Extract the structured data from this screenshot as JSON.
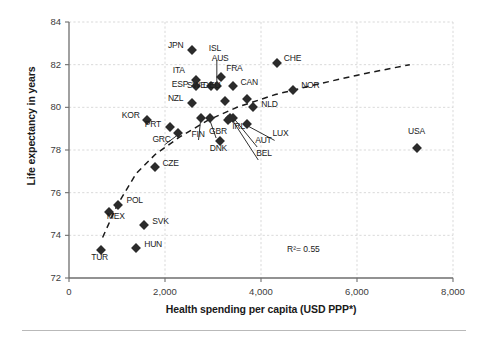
{
  "chart_data": {
    "type": "scatter",
    "title": "",
    "xlabel": "Health spending per capita (USD PPP*)",
    "ylabel": "Life expectancy in years",
    "xlim": [
      0,
      8000
    ],
    "ylim": [
      72,
      84
    ],
    "xticks": [
      "0",
      "2,000",
      "4,000",
      "6,000",
      "8,000"
    ],
    "xtick_values": [
      0,
      2000,
      4000,
      6000,
      8000
    ],
    "yticks": [
      "72",
      "74",
      "76",
      "78",
      "80",
      "82",
      "84"
    ],
    "ytick_values": [
      72,
      74,
      76,
      78,
      80,
      82,
      84
    ],
    "grid": true,
    "legend": "none",
    "annotations": [
      {
        "name": "r-squared",
        "text": "R²= 0.55",
        "x": 5000,
        "y": 73.3
      }
    ],
    "trendline": {
      "style": "dashed",
      "description": "logarithmic fit rising from lower-left to upper-right",
      "points": [
        {
          "x": 700,
          "y": 73.9
        },
        {
          "x": 1000,
          "y": 75.4
        },
        {
          "x": 1400,
          "y": 76.9
        },
        {
          "x": 1800,
          "y": 77.8
        },
        {
          "x": 2300,
          "y": 78.6
        },
        {
          "x": 2900,
          "y": 79.4
        },
        {
          "x": 3500,
          "y": 80.0
        },
        {
          "x": 4300,
          "y": 80.6
        },
        {
          "x": 5200,
          "y": 81.1
        },
        {
          "x": 6200,
          "y": 81.6
        },
        {
          "x": 7100,
          "y": 82.0
        }
      ]
    },
    "points": [
      {
        "label": "JPN",
        "x": 2560,
        "y": 82.7,
        "label_pos": "left"
      },
      {
        "label": "ISL",
        "x": 3080,
        "y": 81.0,
        "label_pos": "leader-up"
      },
      {
        "label": "AUS",
        "x": 3160,
        "y": 81.4,
        "label_pos": "above"
      },
      {
        "label": "ITA",
        "x": 2640,
        "y": 81.3,
        "label_pos": "left-upper"
      },
      {
        "label": "ESP",
        "x": 2640,
        "y": 81.0,
        "label_pos": "left"
      },
      {
        "label": "SWE",
        "x": 2960,
        "y": 81.0,
        "label_pos": "left"
      },
      {
        "label": "FRA",
        "x": 3420,
        "y": 81.0,
        "label_pos": "above"
      },
      {
        "label": "CHE",
        "x": 4330,
        "y": 82.1,
        "label_pos": "right"
      },
      {
        "label": "CAN",
        "x": 3700,
        "y": 80.4,
        "label_pos": "above"
      },
      {
        "label": "NOR",
        "x": 4670,
        "y": 80.8,
        "label_pos": "right"
      },
      {
        "label": "DEU",
        "x": 3250,
        "y": 80.3,
        "label_pos": "above-left"
      },
      {
        "label": "NLD",
        "x": 3840,
        "y": 80.0,
        "label_pos": "right"
      },
      {
        "label": "NZL",
        "x": 2560,
        "y": 80.2,
        "label_pos": "left"
      },
      {
        "label": "KOR",
        "x": 1620,
        "y": 79.4,
        "label_pos": "left"
      },
      {
        "label": "PRT",
        "x": 2100,
        "y": 79.1,
        "label_pos": "left"
      },
      {
        "label": "GRC",
        "x": 2280,
        "y": 78.8,
        "label_pos": "leader-down"
      },
      {
        "label": "FIN",
        "x": 2740,
        "y": 79.5,
        "label_pos": "leader-down"
      },
      {
        "label": "GBR",
        "x": 2940,
        "y": 79.5,
        "label_pos": "leader-down"
      },
      {
        "label": "IRL",
        "x": 3320,
        "y": 79.4,
        "label_pos": "below-right"
      },
      {
        "label": "LUX",
        "x": 3700,
        "y": 79.2,
        "label_pos": "leader-right"
      },
      {
        "label": "AUT",
        "x": 3420,
        "y": 79.5,
        "label_pos": "leader-right"
      },
      {
        "label": "BEL",
        "x": 3360,
        "y": 79.5,
        "label_pos": "leader-right"
      },
      {
        "label": "DNK",
        "x": 3140,
        "y": 78.4,
        "label_pos": "below"
      },
      {
        "label": "USA",
        "x": 7250,
        "y": 78.1,
        "label_pos": "above"
      },
      {
        "label": "CZE",
        "x": 1800,
        "y": 77.2,
        "label_pos": "right"
      },
      {
        "label": "POL",
        "x": 1030,
        "y": 75.4,
        "label_pos": "right"
      },
      {
        "label": "MEX",
        "x": 830,
        "y": 75.1,
        "label_pos": "below-right"
      },
      {
        "label": "SVK",
        "x": 1570,
        "y": 74.5,
        "label_pos": "right"
      },
      {
        "label": "HUN",
        "x": 1400,
        "y": 73.4,
        "label_pos": "right"
      },
      {
        "label": "TUR",
        "x": 670,
        "y": 73.3,
        "label_pos": "below"
      }
    ]
  }
}
